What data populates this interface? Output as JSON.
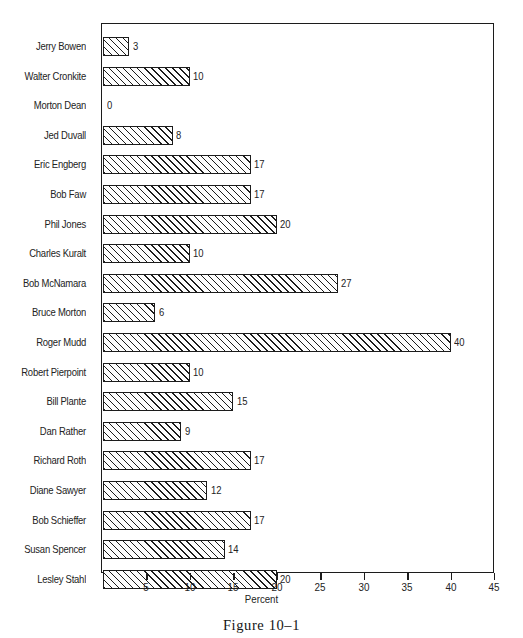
{
  "chart_data": {
    "type": "bar",
    "orientation": "horizontal",
    "title": "",
    "subtitle": "",
    "caption": "Figure 10–1",
    "xlabel": "Percent",
    "ylabel": "",
    "xlim": [
      0,
      45
    ],
    "xticks": [
      5,
      10,
      15,
      20,
      25,
      30,
      35,
      40,
      45
    ],
    "xtick_labels": [
      "5",
      "10",
      "15",
      "20",
      "25",
      "30",
      "35",
      "40",
      "45"
    ],
    "grid": false,
    "legend": null,
    "bar_style": "diagonal-hatch-outline",
    "value_labels_shown": true,
    "categories": [
      "Jerry Bowen",
      "Walter Cronkite",
      "Morton Dean",
      "Jed Duvall",
      "Eric Engberg",
      "Bob Faw",
      "Phil Jones",
      "Charles Kuralt",
      "Bob McNamara",
      "Bruce Morton",
      "Roger Mudd",
      "Robert Pierpoint",
      "Bill Plante",
      "Dan Rather",
      "Richard Roth",
      "Diane Sawyer",
      "Bob Schieffer",
      "Susan Spencer",
      "Lesley Stahl"
    ],
    "values": [
      3,
      10,
      0,
      8,
      17,
      17,
      20,
      10,
      27,
      6,
      40,
      10,
      15,
      9,
      17,
      12,
      17,
      14,
      20
    ],
    "value_labels": [
      "3",
      "10",
      "0",
      "8",
      "17",
      "17",
      "20",
      "10",
      "27",
      "6",
      "40",
      "10",
      "15",
      "9",
      "17",
      "12",
      "17",
      "14",
      "20"
    ]
  },
  "colors": {
    "ink": "#1c1c1c",
    "text": "#232323",
    "background": "#ffffff",
    "bar_fill": "#fdfdfd"
  }
}
